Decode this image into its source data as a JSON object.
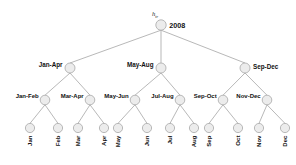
{
  "figure": {
    "name": "hierarchical-time-tree",
    "background_color": "#ffffff",
    "node_fill": "#ececec",
    "node_stroke": "#a8a8a8",
    "edge_color": "#9a9a9a",
    "text_color": "#111111"
  },
  "annotation": {
    "symbol": "h",
    "subscript": "tr"
  },
  "levels": {
    "root": {
      "label": "2008",
      "label_side": "right"
    },
    "quarters": [
      {
        "label": "Jan-Apr",
        "label_side": "left"
      },
      {
        "label": "May-Aug",
        "label_side": "left"
      },
      {
        "label": "Sep-Dec",
        "label_side": "right"
      }
    ],
    "pairs": [
      {
        "label": "Jan-Feb"
      },
      {
        "label": "Mar-Apr"
      },
      {
        "label": "May-Jun"
      },
      {
        "label": "Jul-Aug"
      },
      {
        "label": "Sep-Oct"
      },
      {
        "label": "Nov-Dec"
      }
    ],
    "months": [
      {
        "label": "Jan"
      },
      {
        "label": "Feb"
      },
      {
        "label": "Mar"
      },
      {
        "label": "Apr"
      },
      {
        "label": "May"
      },
      {
        "label": "Jun"
      },
      {
        "label": "Jul"
      },
      {
        "label": "Aug"
      },
      {
        "label": "Sep"
      },
      {
        "label": "Oct"
      },
      {
        "label": "Nov"
      },
      {
        "label": "Dec"
      }
    ]
  },
  "geometry": {
    "root": {
      "x": 161,
      "y": 25,
      "r": 5.2
    },
    "quarters": [
      {
        "x": 70,
        "y": 68,
        "r": 5.0
      },
      {
        "x": 161,
        "y": 68,
        "r": 5.0
      },
      {
        "x": 245,
        "y": 68,
        "r": 5.0
      }
    ],
    "pairs": [
      {
        "x": 45,
        "y": 100,
        "r": 4.8
      },
      {
        "x": 90,
        "y": 100,
        "r": 4.8
      },
      {
        "x": 135,
        "y": 100,
        "r": 4.8
      },
      {
        "x": 180,
        "y": 100,
        "r": 4.8
      },
      {
        "x": 223,
        "y": 100,
        "r": 4.8
      },
      {
        "x": 267,
        "y": 100,
        "r": 4.8
      }
    ],
    "months": [
      {
        "x": 30,
        "y": 128,
        "r": 4.6
      },
      {
        "x": 58,
        "y": 128,
        "r": 4.6
      },
      {
        "x": 78,
        "y": 128,
        "r": 4.6
      },
      {
        "x": 104,
        "y": 128,
        "r": 4.6
      },
      {
        "x": 118,
        "y": 128,
        "r": 4.6
      },
      {
        "x": 147,
        "y": 128,
        "r": 4.6
      },
      {
        "x": 170,
        "y": 128,
        "r": 4.6
      },
      {
        "x": 194,
        "y": 128,
        "r": 4.6
      },
      {
        "x": 209,
        "y": 128,
        "r": 4.6
      },
      {
        "x": 238,
        "y": 128,
        "r": 4.6
      },
      {
        "x": 259,
        "y": 128,
        "r": 4.6
      },
      {
        "x": 285,
        "y": 128,
        "r": 4.6
      }
    ]
  }
}
